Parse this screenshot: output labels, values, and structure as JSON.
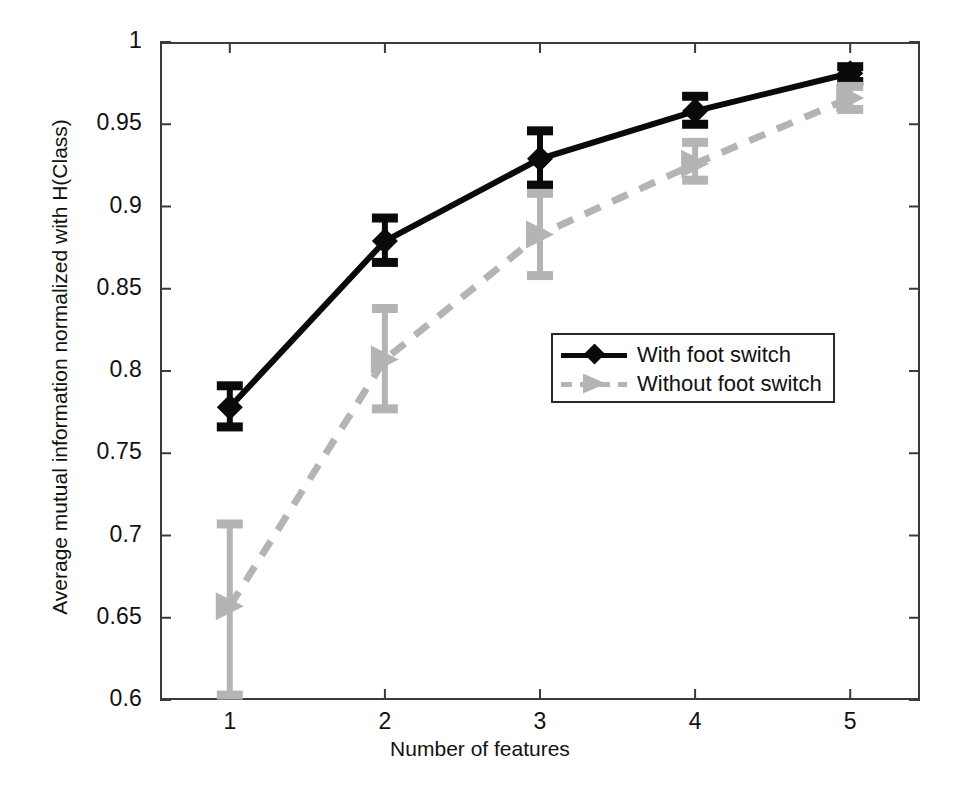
{
  "chart_data": {
    "type": "line",
    "title": "",
    "xlabel": "Number of features",
    "ylabel": "Average mutual information normalized with H(Class)",
    "x": [
      1,
      2,
      3,
      4,
      5
    ],
    "xticklabels": [
      "1",
      "2",
      "3",
      "4",
      "5"
    ],
    "yticks": [
      0.6,
      0.65,
      0.7,
      0.75,
      0.8,
      0.85,
      0.9,
      0.95,
      1
    ],
    "yticklabels": [
      "0.6",
      "0.65",
      "0.7",
      "0.75",
      "0.8",
      "0.85",
      "0.9",
      "0.95",
      "1"
    ],
    "xlim": [
      0.55,
      5.45
    ],
    "ylim": [
      0.6,
      1.0
    ],
    "grid": false,
    "legend_position": "center-right",
    "series": [
      {
        "name": "With foot switch",
        "color": "#0a0a0a",
        "linestyle": "solid",
        "marker": "diamond",
        "values": [
          0.778,
          0.879,
          0.929,
          0.958,
          0.981
        ],
        "err_low": [
          0.766,
          0.866,
          0.913,
          0.95,
          0.976
        ],
        "err_high": [
          0.791,
          0.893,
          0.946,
          0.967,
          0.985
        ]
      },
      {
        "name": "Without foot switch",
        "color": "#b4b4b4",
        "linestyle": "dashed",
        "marker": "right-triangle",
        "values": [
          0.657,
          0.807,
          0.883,
          0.926,
          0.966
        ],
        "err_low": [
          0.603,
          0.777,
          0.858,
          0.916,
          0.959
        ],
        "err_high": [
          0.707,
          0.838,
          0.908,
          0.939,
          0.973
        ]
      }
    ]
  },
  "legend": {
    "items": [
      {
        "label": "With foot switch"
      },
      {
        "label": "Without foot switch"
      }
    ]
  },
  "axes": {
    "x_title": "Number of features",
    "y_title": "Average mutual information normalized with H(Class)"
  }
}
